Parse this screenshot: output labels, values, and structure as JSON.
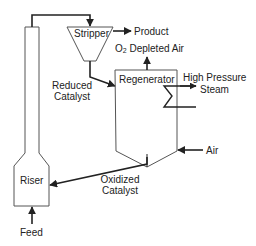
{
  "diagram": {
    "units": {
      "riser": "Riser",
      "stripper": "Stripper",
      "regenerator": "Regenerator"
    },
    "streams": {
      "product": "Product",
      "o2_prefix": "O",
      "o2_sub": "2",
      "depleted_air": "Depleted Air",
      "reduced_catalyst_line1": "Reduced",
      "reduced_catalyst_line2": "Catalyst",
      "hp_steam_line1": "High Pressure",
      "hp_steam_line2": "Steam",
      "air": "Air",
      "oxidized_catalyst_line1": "Oxidized",
      "oxidized_catalyst_line2": "Catalyst",
      "feed": "Feed"
    },
    "colors": {
      "line": "#222222",
      "vessel": "#555555",
      "background": "#ffffff"
    }
  }
}
